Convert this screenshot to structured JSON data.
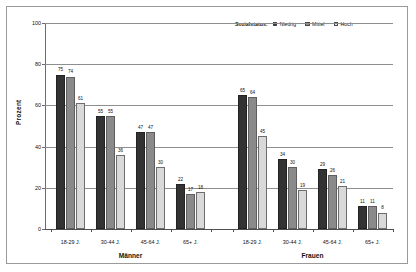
{
  "chart_data": {
    "type": "bar",
    "title": "",
    "xlabel": "",
    "ylabel": "Prozent",
    "ylim": [
      0,
      100
    ],
    "yticks": [
      0,
      20,
      40,
      60,
      80,
      100
    ],
    "grid": true,
    "legend": {
      "position": "top-right",
      "title": "Sozialstatus:",
      "entries": [
        {
          "name": "Niedrig",
          "color": "#333333"
        },
        {
          "name": "Mittel",
          "color": "#8a8a8a"
        },
        {
          "name": "Hoch",
          "color": "#d9d9d9"
        }
      ]
    },
    "panels": [
      {
        "name": "Männer",
        "categories": [
          "18-29 J.",
          "30-44 J.",
          "45-64 J.",
          "65+ J."
        ],
        "series": [
          {
            "name": "Niedrig",
            "values": [
              75,
              55,
              47,
              22
            ]
          },
          {
            "name": "Mittel",
            "values": [
              74,
              55,
              47,
              17
            ]
          },
          {
            "name": "Hoch",
            "values": [
              61,
              36,
              30,
              18
            ]
          }
        ]
      },
      {
        "name": "Frauen",
        "categories": [
          "18-29 J.",
          "30-44 J.",
          "45-64 J.",
          "65+ J."
        ],
        "series": [
          {
            "name": "Niedrig",
            "values": [
              65,
              34,
              29,
              11
            ]
          },
          {
            "name": "Mittel",
            "values": [
              64,
              30,
              26,
              11
            ]
          },
          {
            "name": "Hoch",
            "values": [
              45,
              19,
              21,
              8
            ]
          }
        ]
      }
    ]
  }
}
